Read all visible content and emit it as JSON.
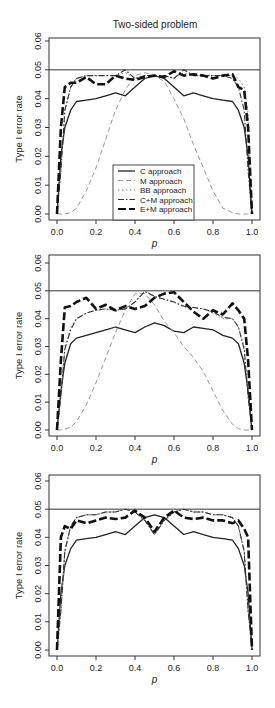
{
  "figure": {
    "title": "Two-sided problem",
    "reference_line": 0.05
  },
  "legend": {
    "entries": [
      {
        "label": "C approach",
        "style": "solid"
      },
      {
        "label": "M approach",
        "style": "dashed-gray"
      },
      {
        "label": "BB approach",
        "style": "dotted"
      },
      {
        "label": "C+M approach",
        "style": "dotdash"
      },
      {
        "label": "E+M approach",
        "style": "longdash-thick"
      }
    ]
  },
  "chart_data": [
    {
      "type": "line",
      "title": "Two-sided problem",
      "xlabel": "p",
      "ylabel": "Type I error rate",
      "xlim": [
        0,
        1
      ],
      "ylim": [
        0,
        0.06
      ],
      "xticks": [
        "0.0",
        "0.2",
        "0.4",
        "0.6",
        "0.8",
        "1.0"
      ],
      "yticks": [
        "0.00",
        "0.01",
        "0.02",
        "0.03",
        "0.04",
        "0.05",
        "0.06"
      ],
      "hline": 0.05,
      "grid": false,
      "legend_position": "bottom-center",
      "x": [
        0.0,
        0.02,
        0.04,
        0.07,
        0.1,
        0.15,
        0.2,
        0.25,
        0.3,
        0.35,
        0.4,
        0.45,
        0.5,
        0.55,
        0.6,
        0.65,
        0.7,
        0.75,
        0.8,
        0.85,
        0.9,
        0.93,
        0.96,
        0.98,
        1.0
      ],
      "series": [
        {
          "name": "C approach",
          "values": [
            0.0,
            0.02,
            0.03,
            0.036,
            0.039,
            0.0395,
            0.04,
            0.041,
            0.042,
            0.041,
            0.044,
            0.047,
            0.048,
            0.047,
            0.044,
            0.041,
            0.042,
            0.041,
            0.04,
            0.0395,
            0.039,
            0.036,
            0.03,
            0.02,
            0.0
          ]
        },
        {
          "name": "M approach",
          "values": [
            0.0,
            0.0,
            0.0,
            0.0005,
            0.002,
            0.008,
            0.016,
            0.026,
            0.036,
            0.043,
            0.048,
            0.049,
            0.048,
            0.046,
            0.04,
            0.033,
            0.024,
            0.016,
            0.008,
            0.002,
            0.0005,
            0.0,
            0.0,
            0.0,
            0.0
          ]
        },
        {
          "name": "BB approach",
          "values": [
            0.0,
            0.015,
            0.035,
            0.044,
            0.047,
            0.048,
            0.048,
            0.048,
            0.048,
            0.049,
            0.047,
            0.048,
            0.048,
            0.048,
            0.047,
            0.049,
            0.048,
            0.048,
            0.048,
            0.048,
            0.048,
            0.047,
            0.044,
            0.035,
            0.0
          ]
        },
        {
          "name": "C+M approach",
          "values": [
            0.0,
            0.015,
            0.036,
            0.044,
            0.047,
            0.048,
            0.048,
            0.048,
            0.048,
            0.05,
            0.047,
            0.048,
            0.048,
            0.048,
            0.047,
            0.05,
            0.048,
            0.048,
            0.048,
            0.048,
            0.047,
            0.044,
            0.036,
            0.015,
            0.0
          ]
        },
        {
          "name": "E+M approach",
          "values": [
            0.0,
            0.03,
            0.044,
            0.0455,
            0.0455,
            0.0475,
            0.045,
            0.045,
            0.048,
            0.047,
            0.0465,
            0.0475,
            0.048,
            0.0475,
            0.0495,
            0.048,
            0.0485,
            0.048,
            0.047,
            0.048,
            0.0485,
            0.044,
            0.043,
            0.03,
            0.0
          ]
        }
      ]
    },
    {
      "type": "line",
      "title": "",
      "xlabel": "p",
      "ylabel": "Type I error rate",
      "xlim": [
        0,
        1
      ],
      "ylim": [
        0,
        0.06
      ],
      "xticks": [
        "0.0",
        "0.2",
        "0.4",
        "0.6",
        "0.8",
        "1.0"
      ],
      "yticks": [
        "0.00",
        "0.01",
        "0.02",
        "0.03",
        "0.04",
        "0.05",
        "0.06"
      ],
      "hline": 0.05,
      "grid": false,
      "x": [
        0.0,
        0.02,
        0.04,
        0.07,
        0.1,
        0.15,
        0.2,
        0.25,
        0.3,
        0.35,
        0.4,
        0.45,
        0.5,
        0.55,
        0.6,
        0.65,
        0.7,
        0.75,
        0.8,
        0.85,
        0.9,
        0.93,
        0.96,
        0.98,
        1.0
      ],
      "series": [
        {
          "name": "C approach",
          "values": [
            0.0,
            0.014,
            0.024,
            0.031,
            0.033,
            0.034,
            0.035,
            0.036,
            0.037,
            0.036,
            0.035,
            0.037,
            0.0385,
            0.0375,
            0.0355,
            0.035,
            0.037,
            0.0365,
            0.036,
            0.034,
            0.033,
            0.031,
            0.024,
            0.014,
            0.0
          ]
        },
        {
          "name": "M approach",
          "values": [
            0.0,
            0.0,
            0.0003,
            0.001,
            0.003,
            0.009,
            0.017,
            0.026,
            0.035,
            0.043,
            0.049,
            0.049,
            0.045,
            0.039,
            0.035,
            0.03,
            0.026,
            0.021,
            0.014,
            0.007,
            0.002,
            0.0005,
            0.0,
            0.0,
            0.0
          ]
        },
        {
          "name": "BB approach",
          "values": [
            0.0,
            0.012,
            0.03,
            0.037,
            0.04,
            0.042,
            0.043,
            0.0435,
            0.043,
            0.0435,
            0.046,
            0.05,
            0.048,
            0.047,
            0.046,
            0.044,
            0.044,
            0.0435,
            0.042,
            0.04,
            0.04,
            0.037,
            0.03,
            0.012,
            0.0
          ]
        },
        {
          "name": "C+M approach",
          "values": [
            0.0,
            0.012,
            0.029,
            0.036,
            0.04,
            0.042,
            0.043,
            0.0435,
            0.043,
            0.0435,
            0.046,
            0.0498,
            0.048,
            0.047,
            0.046,
            0.0445,
            0.044,
            0.0435,
            0.0425,
            0.0405,
            0.04,
            0.037,
            0.029,
            0.012,
            0.0
          ]
        },
        {
          "name": "E+M approach",
          "values": [
            0.0,
            0.025,
            0.044,
            0.0445,
            0.046,
            0.0475,
            0.0435,
            0.045,
            0.043,
            0.0445,
            0.0435,
            0.0445,
            0.0475,
            0.049,
            0.0495,
            0.046,
            0.0425,
            0.04,
            0.043,
            0.0415,
            0.0455,
            0.043,
            0.04,
            0.025,
            0.0
          ]
        }
      ]
    },
    {
      "type": "line",
      "title": "",
      "xlabel": "p",
      "ylabel": "Type I error rate",
      "xlim": [
        0,
        1
      ],
      "ylim": [
        0,
        0.06
      ],
      "xticks": [
        "0.0",
        "0.2",
        "0.4",
        "0.6",
        "0.8",
        "1.0"
      ],
      "yticks": [
        "0.00",
        "0.01",
        "0.02",
        "0.03",
        "0.04",
        "0.05",
        "0.06"
      ],
      "hline": 0.05,
      "grid": false,
      "x": [
        0.0,
        0.02,
        0.04,
        0.07,
        0.1,
        0.15,
        0.2,
        0.25,
        0.3,
        0.35,
        0.4,
        0.45,
        0.5,
        0.55,
        0.6,
        0.65,
        0.7,
        0.75,
        0.8,
        0.85,
        0.9,
        0.93,
        0.96,
        0.98,
        1.0
      ],
      "series": [
        {
          "name": "C approach",
          "values": [
            0.0,
            0.02,
            0.03,
            0.036,
            0.039,
            0.0395,
            0.04,
            0.041,
            0.042,
            0.041,
            0.044,
            0.047,
            0.048,
            0.047,
            0.044,
            0.041,
            0.042,
            0.041,
            0.04,
            0.0395,
            0.039,
            0.036,
            0.03,
            0.02,
            0.0
          ]
        },
        {
          "name": "M approach",
          "values": [
            0.0,
            0.014,
            0.035,
            0.044,
            0.047,
            0.048,
            0.048,
            0.049,
            0.049,
            0.05,
            0.049,
            0.046,
            0.041,
            0.046,
            0.049,
            0.05,
            0.049,
            0.049,
            0.048,
            0.048,
            0.047,
            0.044,
            0.035,
            0.014,
            0.0
          ]
        },
        {
          "name": "BB approach",
          "values": [
            0.0,
            0.014,
            0.035,
            0.044,
            0.047,
            0.048,
            0.048,
            0.049,
            0.049,
            0.05,
            0.049,
            0.046,
            0.041,
            0.046,
            0.049,
            0.05,
            0.049,
            0.049,
            0.048,
            0.048,
            0.047,
            0.044,
            0.035,
            0.014,
            0.0
          ]
        },
        {
          "name": "C+M approach",
          "values": [
            0.0,
            0.014,
            0.035,
            0.044,
            0.047,
            0.048,
            0.048,
            0.049,
            0.049,
            0.05,
            0.049,
            0.046,
            0.041,
            0.046,
            0.049,
            0.05,
            0.049,
            0.049,
            0.048,
            0.048,
            0.047,
            0.044,
            0.035,
            0.014,
            0.0
          ]
        },
        {
          "name": "E+M approach",
          "values": [
            0.0,
            0.04,
            0.044,
            0.043,
            0.046,
            0.045,
            0.046,
            0.047,
            0.0465,
            0.047,
            0.0495,
            0.047,
            0.042,
            0.047,
            0.0495,
            0.047,
            0.0465,
            0.047,
            0.046,
            0.046,
            0.045,
            0.046,
            0.043,
            0.04,
            0.0
          ]
        }
      ]
    }
  ]
}
